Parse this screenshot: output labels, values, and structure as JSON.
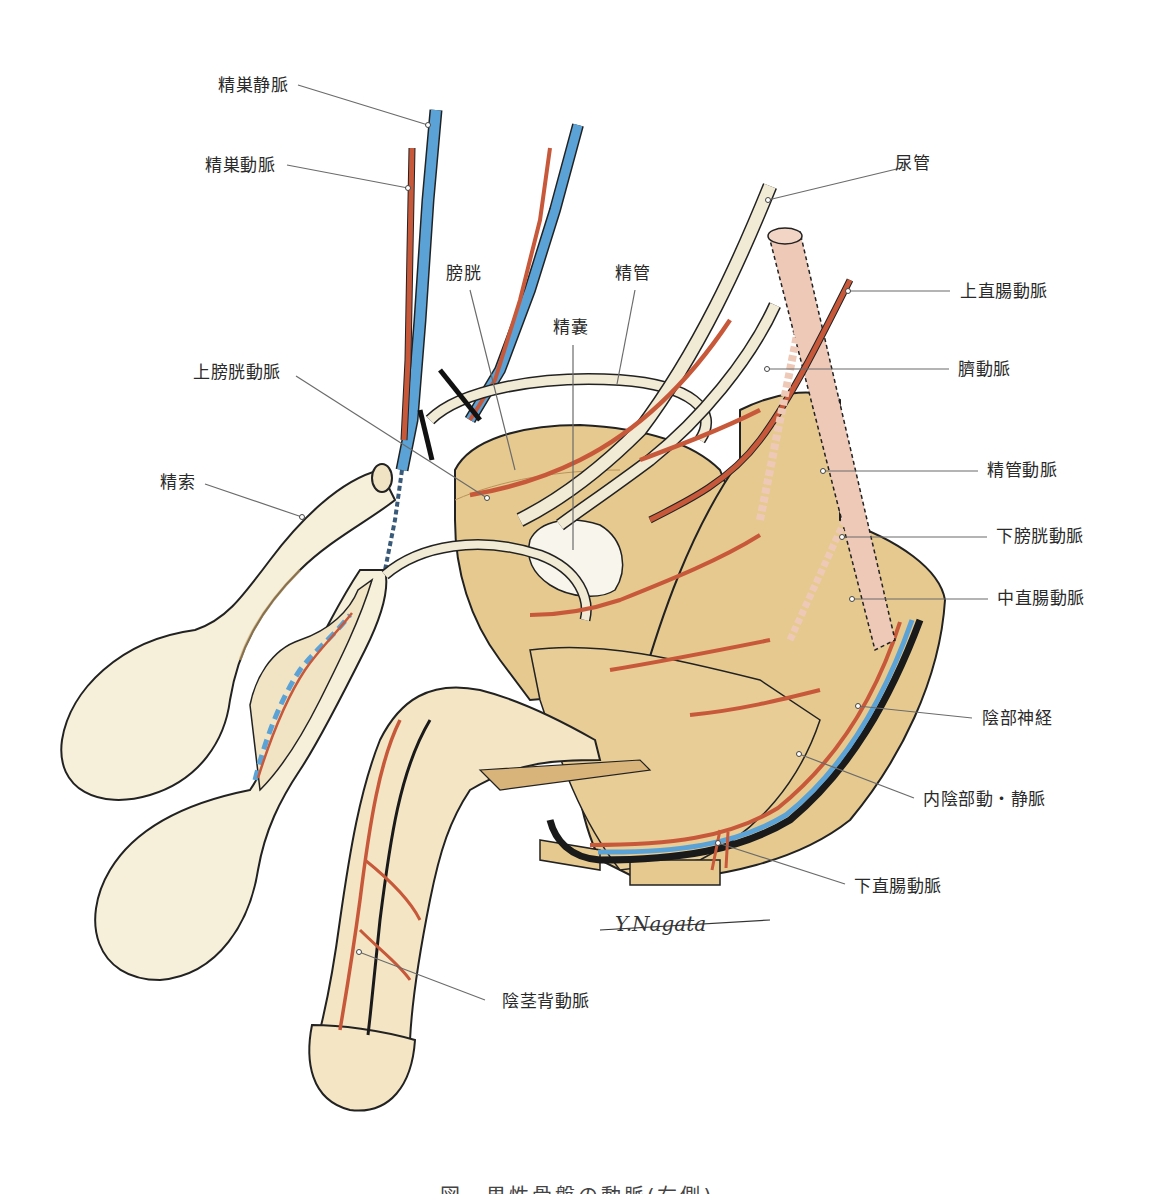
{
  "figure": {
    "caption": "図　男性骨盤の動脈(右側)",
    "signature": "Y.Nagata",
    "colors": {
      "artery": "#c8583a",
      "vein": "#5ba3d6",
      "nerve": "#1a1a1a",
      "tissue": "#e6c98f",
      "tissue_light": "#f3e6c8",
      "pale_duct": "#f1ead4",
      "rectum_pink": "#efc9b8",
      "leader_line": "#6b6b6b"
    }
  },
  "labels": {
    "testicular_vein": "精巣静脈",
    "testicular_artery": "精巣動脈",
    "bladder": "膀胱",
    "seminal_vesicle": "精嚢",
    "vas_deferens": "精管",
    "ureter": "尿管",
    "superior_rectal_artery": "上直腸動脈",
    "umbilical_artery": "臍動脈",
    "superior_vesical_artery": "上膀胱動脈",
    "spermatic_cord": "精索",
    "artery_of_vas_deferens": "精管動脈",
    "inferior_vesical_artery": "下膀胱動脈",
    "middle_rectal_artery": "中直腸動脈",
    "pudendal_nerve": "陰部神経",
    "internal_pudendal_vessels": "内陰部動・静脈",
    "inferior_rectal_artery": "下直腸動脈",
    "dorsal_artery_of_penis": "陰茎背動脈"
  }
}
